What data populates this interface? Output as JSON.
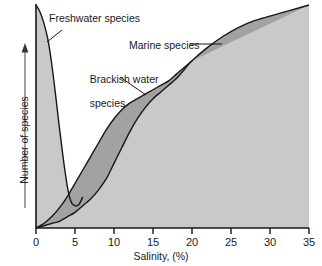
{
  "chart_data": {
    "type": "area",
    "title": "",
    "xlabel": "Salinity, (%)",
    "ylabel": "Number of species",
    "xlim": [
      0,
      35
    ],
    "ylim": [
      0,
      100
    ],
    "grid": false,
    "legend_position": "inline-annotations",
    "xticks": [
      "0",
      "5",
      "10",
      "15",
      "20",
      "25",
      "30",
      "35"
    ],
    "xtick_values": [
      0,
      5,
      10,
      15,
      20,
      25,
      30,
      35
    ],
    "yticks": [],
    "y_axis_arrow": true,
    "y_axis_note": "unlabeled ordinate, increasing upward",
    "series": [
      {
        "name": "Freshwater species",
        "label": "Freshwater species",
        "note": "declines steeply from maximum at zero salinity to a minimum near 5%",
        "x": [
          0,
          0.5,
          1,
          1.5,
          2,
          2.5,
          3,
          3.5,
          4,
          4.3,
          4.6,
          5,
          5.3,
          5.6,
          6
        ],
        "values": [
          100,
          97,
          92,
          85,
          74,
          60,
          45,
          31,
          19,
          14,
          11,
          10,
          10,
          11,
          14
        ]
      },
      {
        "name": "Brackish water species",
        "label": "Brackish water species",
        "note": "upper bound of the dark band; rises from origin and merges with the marine curve near 20%",
        "x": [
          0,
          1,
          2,
          3,
          4,
          5,
          6,
          7,
          8,
          9,
          10,
          11,
          12,
          13,
          14,
          15,
          16,
          17,
          18,
          19,
          20
        ],
        "values": [
          0,
          2,
          5,
          9,
          14,
          20,
          26,
          32,
          38,
          44,
          49,
          53,
          56,
          58,
          60,
          62,
          64,
          66,
          69,
          72,
          75
        ]
      },
      {
        "name": "Marine species",
        "label": "Marine species",
        "note": "lower bound of the dark band below 20%; rises to maximum at 35% salinity",
        "x": [
          0,
          1,
          2,
          3,
          4,
          5,
          6,
          7,
          8,
          9,
          10,
          11,
          12,
          13,
          14,
          15,
          16,
          17,
          18,
          19,
          20,
          22,
          24,
          26,
          28,
          30,
          32,
          34,
          35
        ],
        "values": [
          0,
          1,
          2,
          3,
          5,
          7,
          10,
          13,
          17,
          22,
          29,
          36,
          43,
          49,
          54,
          58,
          61,
          64,
          67,
          71,
          75,
          81,
          86,
          90,
          93,
          95,
          97,
          99,
          100
        ]
      }
    ],
    "annotations": [
      {
        "text": "Freshwater species",
        "points_to": "freshwater curve"
      },
      {
        "text": "Marine species",
        "points_to": "marine curve"
      },
      {
        "text": "Brackish water species",
        "points_to": "brackish band"
      }
    ]
  },
  "labels": {
    "freshwater": "Freshwater species",
    "marine": "Marine species",
    "brackish_line1": "Brackish water",
    "brackish_line2": "species",
    "xaxis": "Salinity, (%)",
    "yaxis": "Number of species"
  },
  "ticks": {
    "x": [
      "0",
      "5",
      "10",
      "15",
      "20",
      "25",
      "30",
      "35"
    ]
  },
  "colors": {
    "light_fill": "#c9c9c9",
    "dark_fill": "#a2a2a2",
    "curve": "#171717",
    "axis": "#171717",
    "text": "#1a1a1a",
    "background": "#ffffff"
  }
}
